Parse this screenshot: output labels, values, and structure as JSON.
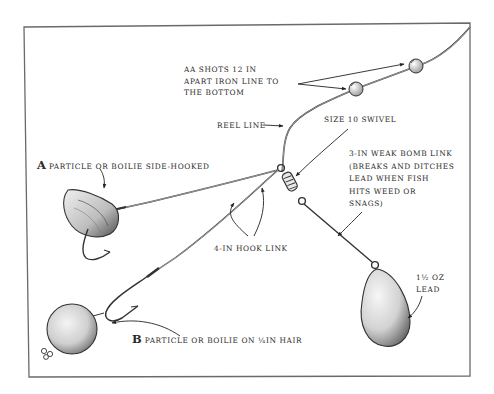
{
  "figure": {
    "frame_color": "#6a6a6a",
    "ink_color": "#2a2a2a"
  },
  "labels": {
    "aa_shots": "AA SHOTS 12 IN\nAPART IRON LINE TO\nTHE BOTTOM",
    "reel_line": "REEL LINE",
    "swivel": "SIZE 10 SWIVEL",
    "bomb_link": "3-IN WEAK BOMB LINK\n(BREAKS AND DITCHES\nLEAD WHEN FISH\nHITS WEED OR\nSNAGS)",
    "a_letter": "A",
    "a_text": "PARTICLE OR BOILIE SIDE-HOOKED",
    "hook_link": "4-IN HOOK LINK",
    "b_letter": "B",
    "b_text": "PARTICLE OR BOILIE ON ¼IN HAIR",
    "lead": "1½ OZ\nLEAD"
  }
}
